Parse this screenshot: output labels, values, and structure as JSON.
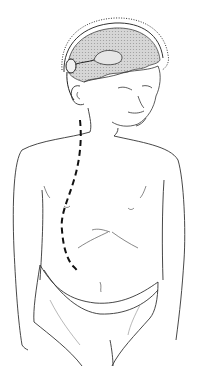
{
  "illustration": {
    "subject": "child-torso-with-shunt-path",
    "colors": {
      "background": "#ffffff",
      "line": "#222222",
      "brain_fill": "#cfcfcf",
      "catheter": "#111111"
    }
  }
}
